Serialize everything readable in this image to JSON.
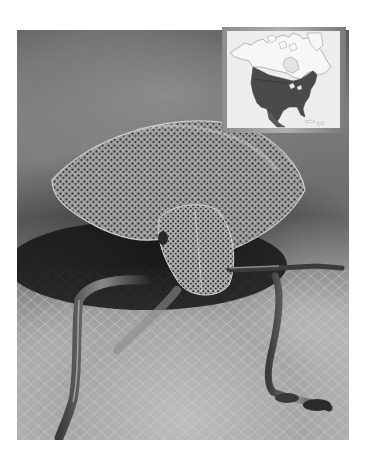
{
  "image": {
    "subject": "stink bug (shield bug) close-up on a leaf",
    "style": "grayscale photograph",
    "colors": {
      "background": "#ffffff",
      "photo_dark": "#1e1e1e",
      "photo_mid": "#7c7c7c",
      "photo_light": "#c4c4c4"
    }
  },
  "map_inset": {
    "subject": "North America range map",
    "range_region": "United States and southern Canada",
    "colors": {
      "frame": "#9a9a9a",
      "land": "#f4f4f4",
      "range": "#4a4a4a",
      "water": "#ededed",
      "outline": "#8a8a8a"
    }
  }
}
